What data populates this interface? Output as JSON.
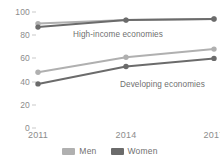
{
  "chart_data": {
    "type": "line",
    "title": "",
    "subtitle": "",
    "xlabel": "",
    "ylabel": "",
    "x": [
      "2011",
      "2014",
      "2017"
    ],
    "categories": [
      "2011",
      "2014",
      "2017"
    ],
    "ylim": [
      0,
      100
    ],
    "xlim": [
      2011,
      2017
    ],
    "yticks": [
      0,
      20,
      40,
      60,
      80,
      100
    ],
    "ytick_labels": [
      "0",
      "20",
      "40",
      "60",
      "80",
      "100"
    ],
    "xtick_labels": [
      "2011",
      "2014",
      "2017"
    ],
    "grid": false,
    "legend_position": "bottom",
    "markers": "circle",
    "series": [
      {
        "name": "High-income economies — Men",
        "group": "High-income economies",
        "legend": "Men",
        "color": "#b0b0b0",
        "values": [
          90,
          93,
          94
        ]
      },
      {
        "name": "High-income economies — Women",
        "group": "High-income economies",
        "legend": "Women",
        "color": "#6b6b6b",
        "values": [
          87,
          93,
          94
        ]
      },
      {
        "name": "Developing economies — Men",
        "group": "Developing economies",
        "legend": "Men",
        "color": "#b0b0b0",
        "values": [
          48,
          61,
          68
        ]
      },
      {
        "name": "Developing economies — Women",
        "group": "Developing economies",
        "legend": "Women",
        "color": "#6b6b6b",
        "values": [
          38,
          53,
          60
        ]
      }
    ],
    "annotations": [
      {
        "text": "High-income economies",
        "x": "2014",
        "y": 83
      },
      {
        "text": "Developing economies",
        "x": "2016",
        "y": 44
      }
    ],
    "legend": [
      {
        "label": "Men",
        "color": "#b0b0b0"
      },
      {
        "label": "Women",
        "color": "#6b6b6b"
      }
    ]
  },
  "colors": {
    "men": "#b0b0b0",
    "women": "#6b6b6b",
    "axis_text": "#8c8c8c",
    "annotation_text": "#6f6f6f",
    "tick_mark": "#c9c9c9",
    "background": "#ffffff"
  }
}
